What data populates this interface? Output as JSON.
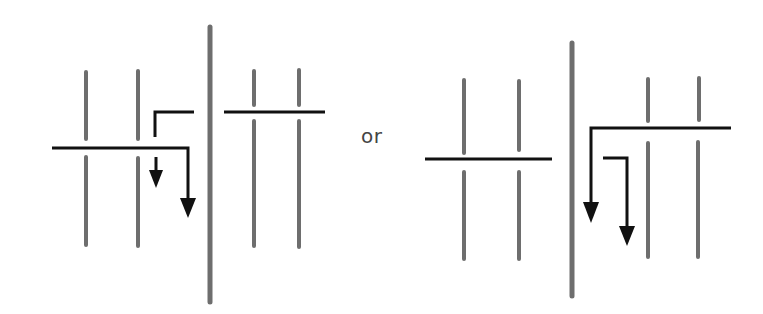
{
  "diagram": {
    "type": "schematic",
    "separator_text": "or",
    "colors": {
      "background": "#ffffff",
      "gray_bar": "#6e6e6e",
      "black_line": "#111111",
      "text": "#444444"
    },
    "panels": [
      {
        "name": "left-option",
        "description": "Two horizontal strands on either side of central barrier; left strand descends with arrows on left side of barrier"
      },
      {
        "name": "right-option",
        "description": "Right strand extends across barrier and descends with two arrows on the right side of barrier"
      }
    ]
  }
}
